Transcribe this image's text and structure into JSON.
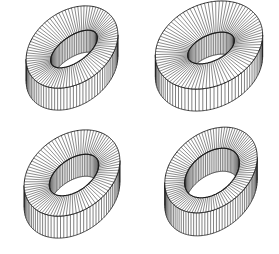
{
  "figure": {
    "width": 279,
    "height": 254,
    "background": "#ffffff",
    "stroke_color": "#1a1a1a",
    "panels": [
      {
        "name": "ring-top-left",
        "cx": 72,
        "cy": 47,
        "outer_rx": 50,
        "outer_ry": 36,
        "inner_rx": 27,
        "inner_ry": 13,
        "inner_dx": 2,
        "inner_dy": 2,
        "rotation_deg": -35,
        "thickness": 22,
        "radial_lines": 90
      },
      {
        "name": "ring-top-right",
        "cx": 209,
        "cy": 45,
        "outer_rx": 56,
        "outer_ry": 41,
        "inner_rx": 25,
        "inner_ry": 13,
        "inner_dx": 2,
        "inner_dy": 3,
        "rotation_deg": -25,
        "thickness": 22,
        "radial_lines": 90
      },
      {
        "name": "ring-bottom-left",
        "cx": 72,
        "cy": 173,
        "outer_rx": 52,
        "outer_ry": 38,
        "inner_rx": 28,
        "inner_ry": 16,
        "inner_dx": 2,
        "inner_dy": 2,
        "rotation_deg": -35,
        "thickness": 22,
        "radial_lines": 90
      },
      {
        "name": "ring-bottom-right",
        "cx": 211,
        "cy": 170,
        "outer_rx": 51,
        "outer_ry": 37,
        "inner_rx": 31,
        "inner_ry": 20,
        "inner_dx": 1,
        "inner_dy": 3,
        "rotation_deg": -38,
        "thickness": 23,
        "radial_lines": 100
      }
    ]
  }
}
